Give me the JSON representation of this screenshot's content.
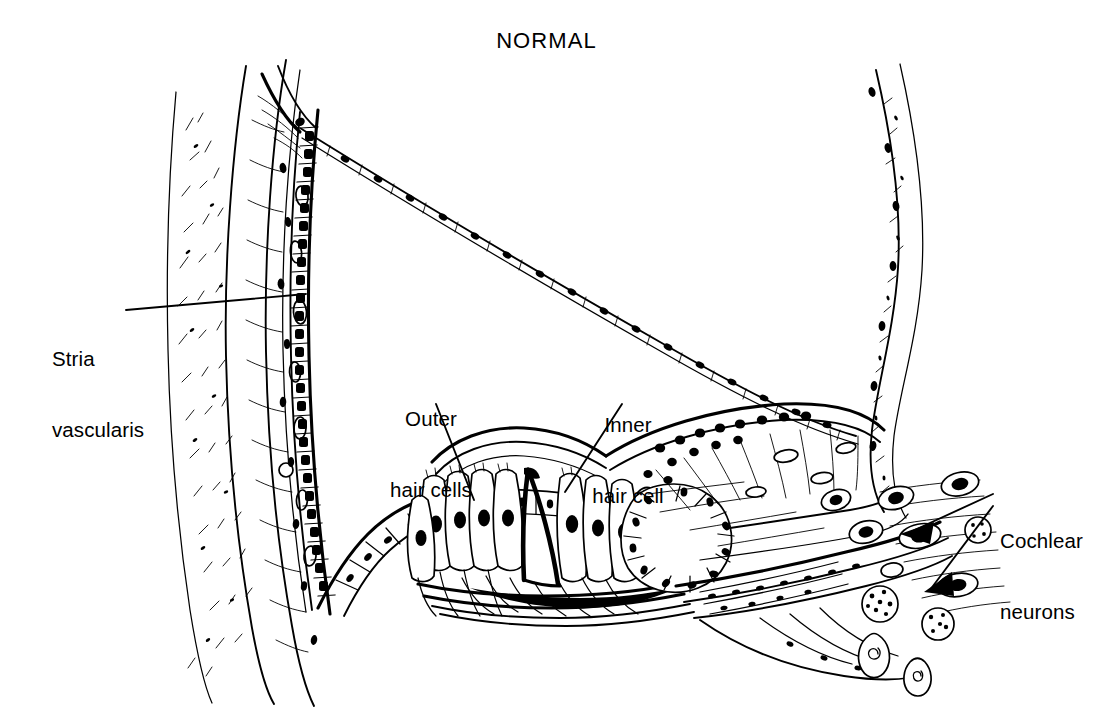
{
  "figure": {
    "title": "NORMAL",
    "style": "black-and-white line drawing",
    "ink_color": "#000000",
    "background_color": "#ffffff",
    "width": 1093,
    "height": 711
  },
  "labels": [
    {
      "id": "stria-vascularis",
      "line1": "Stria",
      "line2": "vascularis",
      "x": 52,
      "y": 300,
      "align": "left",
      "leader": "horizontal line from right of 'Stria' rightward to the stria vascularis band"
    },
    {
      "id": "outer-hair-cells",
      "line1": "Outer",
      "line2": "hair cells",
      "x": 376,
      "y": 360,
      "align": "center",
      "leader": "diagonal line down-right to the outer hair cell row"
    },
    {
      "id": "inner-hair-cell",
      "line1": "Inner",
      "line2": "hair cell",
      "x": 574,
      "y": 366,
      "align": "center",
      "leader": "diagonal line down-right to the inner hair cell"
    },
    {
      "id": "cochlear-neurons",
      "line1": "Cochlear",
      "line2": "neurons",
      "x": 1000,
      "y": 482,
      "align": "left",
      "leader": "two-pronged arrow pointing left to spiral ganglion cell bodies"
    }
  ],
  "structures": [
    {
      "name": "otic-capsule-bone",
      "description": "outer bone wall at far left with stippled texture"
    },
    {
      "name": "spiral-ligament",
      "description": "fibrous tissue band inboard of the left bone wall"
    },
    {
      "name": "stria-vascularis",
      "description": "vertical band of stacked epithelial cells on the lateral wall"
    },
    {
      "name": "reissners-membrane",
      "description": "thin diagonal double-line of flat cells from top-left to right"
    },
    {
      "name": "scala-media",
      "description": "triangular endolymph space between Reissner's membrane and basilar membrane"
    },
    {
      "name": "scala-vestibuli",
      "description": "space above Reissner's membrane"
    },
    {
      "name": "scala-tympani",
      "description": "space below the basilar membrane"
    },
    {
      "name": "organ-of-corti",
      "description": "central cell cluster on the basilar membrane"
    },
    {
      "name": "outer-hair-cells",
      "description": "row of three tall hair cells left of the pillar tunnel"
    },
    {
      "name": "inner-hair-cell",
      "description": "single hair cell right of the pillar tunnel"
    },
    {
      "name": "pillar-cells",
      "description": "dark triangular tunnel of Corti between inner and outer hair cells"
    },
    {
      "name": "tectorial-membrane",
      "description": "curved flap overlying the hair cells"
    },
    {
      "name": "basilar-membrane",
      "description": "thin dark membrane beneath the organ of Corti"
    },
    {
      "name": "inner-sulcus",
      "description": "rounded cell-lined cavity right of the inner hair cell"
    },
    {
      "name": "spiral-limbus",
      "description": "fibrous wedge of tissue right of the inner sulcus"
    },
    {
      "name": "osseous-spiral-lamina",
      "description": "bony shelf carrying nerve fibres to the ganglion"
    },
    {
      "name": "spiral-ganglion",
      "description": "cluster of cochlear neuron cell bodies at lower right"
    },
    {
      "name": "modiolar-wall",
      "description": "curved S-shaped bone band at far right"
    },
    {
      "name": "claudius-cells",
      "description": "cuboidal cell row along the outer basilar curve"
    }
  ],
  "cochlear_neuron_cells": [
    {
      "type": "oval-with-dark-nucleus",
      "count": 6
    },
    {
      "type": "round-stippled",
      "count": 3
    },
    {
      "type": "small-spiral-nucleus",
      "count": 2
    }
  ]
}
